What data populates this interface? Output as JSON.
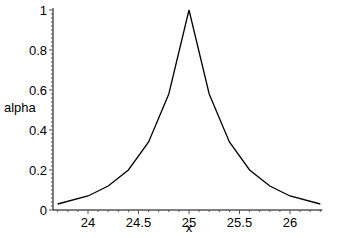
{
  "chart_data": {
    "type": "line",
    "title": "",
    "xlabel": "x",
    "ylabel": "alpha",
    "xlim": [
      23.7,
      26.3
    ],
    "ylim": [
      0,
      1
    ],
    "grid": false,
    "legend": null,
    "x_ticks": [
      24,
      24.5,
      25,
      25.5,
      26
    ],
    "x_tick_labels": [
      "24",
      "24.5",
      "25",
      "25.5",
      "26"
    ],
    "y_ticks": [
      0,
      0.2,
      0.4,
      0.6,
      0.8,
      1
    ],
    "y_tick_labels": [
      "0",
      "0.2",
      "0.4",
      "0.6",
      "0.8",
      "1"
    ],
    "series": [
      {
        "name": "alpha",
        "color": "#000000",
        "x": [
          23.7,
          24.0,
          24.2,
          24.4,
          24.6,
          24.8,
          25.0,
          25.2,
          25.4,
          25.6,
          25.8,
          26.0,
          26.3
        ],
        "y": [
          0.03,
          0.07,
          0.12,
          0.2,
          0.34,
          0.58,
          1.0,
          0.58,
          0.34,
          0.2,
          0.12,
          0.07,
          0.03
        ]
      }
    ]
  }
}
